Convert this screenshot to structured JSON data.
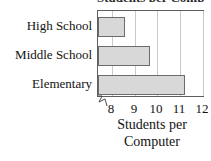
{
  "chart_data": {
    "type": "bar",
    "orientation": "horizontal",
    "title": "Students per Computer",
    "categories": [
      "High School",
      "Middle School",
      "Elementary"
    ],
    "values": [
      8.6,
      9.7,
      11.2
    ],
    "xlabel_lines": [
      "Students per",
      "Computer"
    ],
    "xlabel": "Students per Computer",
    "ylabel": "",
    "xticks": [
      8,
      9,
      10,
      11,
      12
    ],
    "xtick_labels": [
      "8",
      "9",
      "10",
      "11",
      "12"
    ],
    "xlim": [
      7.4,
      12.0
    ],
    "axis_break": true,
    "grid": "vertical",
    "legend": "none",
    "bar_fill_color": "#d8d8d8",
    "bar_border_color": "#6b6b6b",
    "gridline_color": "#c9c9c9",
    "frame_color": "#5e5e5e"
  }
}
